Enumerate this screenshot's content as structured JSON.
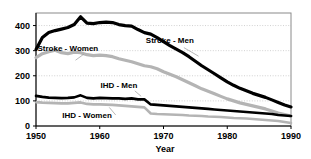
{
  "chart_data": {
    "type": "line",
    "title": "",
    "xlabel": "Year",
    "ylabel": "",
    "xlim": [
      1950,
      1990
    ],
    "ylim": [
      0,
      450
    ],
    "grid": true,
    "grid_axis": "y",
    "legend_position": "inline-annotations",
    "xticks": [
      1950,
      1960,
      1970,
      1980,
      1990
    ],
    "yticks": [
      0,
      100,
      200,
      300,
      400
    ],
    "x": [
      1950,
      1951,
      1952,
      1953,
      1954,
      1955,
      1956,
      1957,
      1958,
      1959,
      1960,
      1961,
      1962,
      1963,
      1964,
      1965,
      1966,
      1967,
      1968,
      1969,
      1970,
      1971,
      1972,
      1973,
      1974,
      1975,
      1976,
      1977,
      1978,
      1979,
      1980,
      1981,
      1982,
      1983,
      1984,
      1985,
      1986,
      1987,
      1988,
      1989,
      1990
    ],
    "series": [
      {
        "name": "Stroke - Men",
        "color": "#000000",
        "width": 3.2,
        "values": [
          305,
          352,
          372,
          380,
          386,
          392,
          404,
          435,
          410,
          408,
          412,
          414,
          412,
          404,
          400,
          398,
          384,
          372,
          366,
          352,
          336,
          320,
          306,
          292,
          276,
          258,
          240,
          224,
          208,
          192,
          176,
          162,
          150,
          140,
          130,
          122,
          114,
          104,
          94,
          84,
          76
        ]
      },
      {
        "name": "Stroke - Women",
        "color": "#b4b4b4",
        "width": 3.2,
        "values": [
          272,
          288,
          296,
          302,
          292,
          288,
          294,
          292,
          284,
          280,
          282,
          280,
          276,
          268,
          262,
          256,
          248,
          240,
          236,
          228,
          216,
          206,
          196,
          184,
          172,
          160,
          148,
          138,
          128,
          118,
          108,
          100,
          92,
          86,
          80,
          74,
          68,
          60,
          52,
          46,
          40
        ]
      },
      {
        "name": "IHD - Men",
        "color": "#000000",
        "width": 2.6,
        "values": [
          120,
          116,
          113,
          112,
          111,
          112,
          114,
          122,
          112,
          110,
          112,
          111,
          110,
          110,
          108,
          110,
          106,
          106,
          86,
          84,
          82,
          80,
          78,
          76,
          74,
          72,
          70,
          68,
          66,
          64,
          62,
          60,
          58,
          56,
          54,
          52,
          50,
          48,
          44,
          42,
          40
        ]
      },
      {
        "name": "IHD - Women",
        "color": "#b4b4b4",
        "width": 2.6,
        "values": [
          95,
          93,
          92,
          91,
          90,
          90,
          92,
          94,
          88,
          86,
          86,
          85,
          84,
          82,
          80,
          78,
          76,
          74,
          50,
          48,
          47,
          46,
          45,
          44,
          42,
          41,
          40,
          38,
          37,
          36,
          34,
          32,
          31,
          30,
          28,
          26,
          24,
          22,
          20,
          16,
          12
        ]
      }
    ],
    "annotations": [
      {
        "text": "Stroke - Men",
        "x": 1971,
        "y": 330
      },
      {
        "text": "Stroke - Women",
        "x": 1955,
        "y": 300
      },
      {
        "text": "IHD - Men",
        "x": 1963,
        "y": 150
      },
      {
        "text": "IHD - Women",
        "x": 1958,
        "y": 32
      }
    ]
  },
  "axes": {
    "x_title": "Year",
    "x_tick_labels": [
      "1950",
      "1960",
      "1970",
      "1980",
      "1990"
    ],
    "y_tick_labels": [
      "0",
      "100",
      "200",
      "300",
      "400"
    ]
  },
  "labels": {
    "stroke_men": "Stroke - Men",
    "stroke_women": "Stroke - Women",
    "ihd_men": "IHD - Men",
    "ihd_women": "IHD - Women"
  },
  "colors": {
    "men_series": "#000000",
    "women_series": "#b4b4b4",
    "grid": "#bdbdbd",
    "frame": "#8a8a8a",
    "background": "#ffffff"
  }
}
